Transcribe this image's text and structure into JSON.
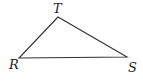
{
  "diagram": {
    "type": "triangle",
    "vertices": [
      {
        "label": "T",
        "x": 58,
        "y": 17
      },
      {
        "label": "R",
        "x": 19,
        "y": 58
      },
      {
        "label": "S",
        "x": 127,
        "y": 57
      }
    ],
    "labels": {
      "T": "T",
      "R": "R",
      "S": "S"
    },
    "stroke_color": "#333333"
  }
}
